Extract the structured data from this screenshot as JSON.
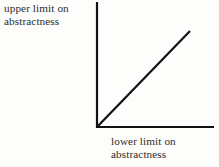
{
  "figure": {
    "background_color": "#fdfdfc",
    "line_color": "#111111",
    "text_color": "#2b2b2b"
  },
  "labels": {
    "upper": {
      "line1": "upper limit on",
      "line2": "abstractness",
      "full": "upper limit on abstractness"
    },
    "lower": {
      "line1": "lower limit on",
      "line2": "abstractness",
      "full": "lower limit on abstractness"
    }
  },
  "chart_data": {
    "type": "line",
    "title": "",
    "xlabel": "lower limit on abstractness",
    "ylabel": "upper limit on abstractness",
    "grid": false,
    "legend": null,
    "axes": {
      "origin": [
        97,
        127
      ],
      "y_axis_top": [
        97,
        2
      ],
      "x_axis_right": [
        214,
        127
      ],
      "axis_width_px": 2
    },
    "series": [
      {
        "name": "upper limit equals lower limit",
        "description": "diagonal 45-degree line from origin",
        "x": [
          0,
          1
        ],
        "y": [
          0,
          1
        ],
        "points_px": [
          [
            97,
            127
          ],
          [
            190,
            31
          ]
        ],
        "slope": 1,
        "line_width_px": 2
      }
    ],
    "xlim": [
      0,
      1.26
    ],
    "ylim": [
      0,
      1.34
    ]
  }
}
